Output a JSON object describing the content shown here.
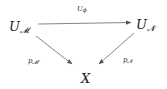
{
  "diagram": {
    "type": "commutative-diagram",
    "nodes": {
      "um": {
        "base": "U",
        "sub": "𝓜"
      },
      "un": {
        "base": "U",
        "sub": "𝓝"
      },
      "x": {
        "base": "X"
      }
    },
    "arrows": {
      "top": {
        "from": "U_M",
        "to": "U_N",
        "label_base": "U",
        "label_sub": "ϕ"
      },
      "left": {
        "from": "U_M",
        "to": "X",
        "label_base": "p",
        "label_sub": "𝓜"
      },
      "right": {
        "from": "U_N",
        "to": "X",
        "label_base": "p",
        "label_sub": "𝓝"
      }
    },
    "colors": {
      "text": "#1a1a1a",
      "arrow": "#555555"
    }
  }
}
